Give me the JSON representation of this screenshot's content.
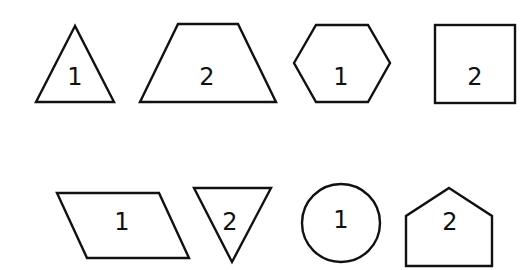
{
  "diagram": {
    "rows": [
      {
        "shapes": [
          {
            "type": "triangle",
            "label": "1"
          },
          {
            "type": "trapezoid",
            "label": "2"
          },
          {
            "type": "hexagon",
            "label": "1"
          },
          {
            "type": "square",
            "label": "2"
          }
        ]
      },
      {
        "shapes": [
          {
            "type": "parallelogram",
            "label": "1"
          },
          {
            "type": "inverted-triangle",
            "label": "2"
          },
          {
            "type": "circle",
            "label": "1"
          },
          {
            "type": "pentagon",
            "label": "2"
          }
        ]
      }
    ],
    "colors": {
      "stroke": "#111111",
      "background": "#ffffff"
    }
  }
}
